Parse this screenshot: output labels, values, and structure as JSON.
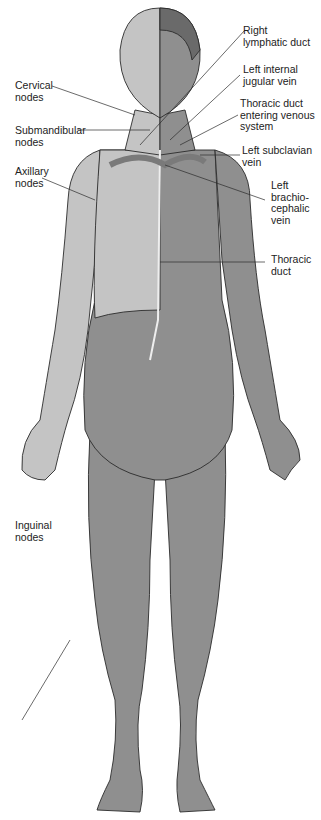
{
  "diagram": {
    "colors": {
      "dark_body": "#8f8f8f",
      "light_region": "#c4c4c4",
      "hair_dark": "#6a6a6a",
      "outline": "#2b2b2b",
      "node": "#eeeeee",
      "vein": "#7a7a7a"
    },
    "labels": {
      "cervical_nodes": "Cervical\nnodes",
      "submandibular_nodes": "Submandibular\nnodes",
      "axillary_nodes": "Axillary\nnodes",
      "inguinal_nodes": "Inguinal\nnodes",
      "right_lymphatic_duct": "Right\nlymphatic duct",
      "left_internal_jugular_vein": "Left internal\njugular vein",
      "thoracic_duct_entering": "Thoracic duct\nentering venous\nsystem",
      "left_subclavian_vein": "Left subclavian\nvein",
      "left_brachiocephalic_vein": "Left\nbrachio-\ncephalic\nvein",
      "thoracic_duct": "Thoracic\nduct"
    }
  }
}
